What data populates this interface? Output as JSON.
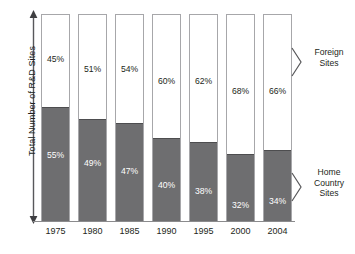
{
  "chart_data": {
    "type": "bar",
    "subtype": "stacked-100-percent",
    "title": "",
    "xlabel": "",
    "ylabel": "Total Number of R&D Sites",
    "ylim": [
      0,
      100
    ],
    "grid": false,
    "legend_position": "right-annotations",
    "categories": [
      "1975",
      "1980",
      "1985",
      "1990",
      "1995",
      "2000",
      "2004"
    ],
    "series": [
      {
        "name": "Foreign Sites",
        "values": [
          45,
          51,
          54,
          60,
          62,
          68,
          66
        ],
        "labels": [
          "45%",
          "51%",
          "54%",
          "60%",
          "62%",
          "68%",
          "66%"
        ],
        "color": "#ffffff",
        "text_color": "#231f20"
      },
      {
        "name": "Home Country Sites",
        "values": [
          55,
          49,
          47,
          40,
          38,
          32,
          34
        ],
        "labels": [
          "55%",
          "49%",
          "47%",
          "40%",
          "38%",
          "32%",
          "34%"
        ],
        "color": "#6e6e70",
        "text_color": "#ffffff"
      }
    ],
    "annotations": [
      {
        "text": "Foreign\nSites",
        "target_series": "Foreign Sites"
      },
      {
        "text": "Home\nCountry\nSites",
        "target_series": "Home Country Sites"
      }
    ]
  },
  "axis": {
    "y_title": "Total Number of R&D Sites",
    "y_arrow_icon": "double-headed-vertical-arrow-icon"
  },
  "annotations": {
    "foreign": "Foreign\nSites",
    "home": "Home\nCountry\nSites"
  },
  "label_offsets": {
    "top": [
      40,
      50,
      50,
      62,
      62,
      72,
      72
    ],
    "bottom": [
      136,
      144,
      152,
      166,
      172,
      186,
      182
    ]
  },
  "colors": {
    "home_fill": "#6e6e70",
    "foreign_fill": "#ffffff",
    "bar_outline": "#a7a7aa",
    "baseline": "#8b8b8d",
    "text": "#231f20"
  }
}
